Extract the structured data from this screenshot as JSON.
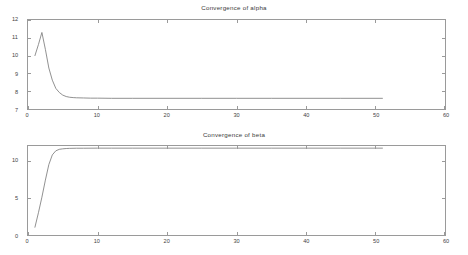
{
  "figure": {
    "background": "#ffffff",
    "axis_color": "#9a9a9a",
    "curve_color": "#7d7d7d"
  },
  "panels": [
    {
      "id": "alpha",
      "title": "Convergence of alpha",
      "xticks": [
        "0",
        "10",
        "20",
        "30",
        "40",
        "50",
        "60"
      ],
      "yticks": [
        "7",
        "8",
        "9",
        "10",
        "11",
        "12"
      ]
    },
    {
      "id": "beta",
      "title": "Convergence of beta",
      "xticks": [
        "0",
        "10",
        "20",
        "30",
        "40",
        "50",
        "60"
      ],
      "yticks": [
        "0",
        "5",
        "10"
      ]
    }
  ],
  "chart_data": [
    {
      "type": "line",
      "title": "Convergence of alpha",
      "xlabel": "",
      "ylabel": "",
      "xlim": [
        0,
        60
      ],
      "ylim": [
        7,
        12
      ],
      "xticks": [
        0,
        10,
        20,
        30,
        40,
        50,
        60
      ],
      "yticks": [
        7,
        8,
        9,
        10,
        11,
        12
      ],
      "grid": false,
      "legend": null,
      "series": [
        {
          "name": "alpha",
          "x": [
            1,
            1.5,
            2,
            2.5,
            3,
            3.5,
            4,
            4.5,
            5,
            5.5,
            6,
            6.5,
            7,
            8,
            9,
            10,
            12,
            15,
            20,
            25,
            30,
            35,
            40,
            45,
            51
          ],
          "y": [
            10.0,
            10.62,
            11.3,
            10.35,
            9.3,
            8.62,
            8.16,
            7.93,
            7.78,
            7.7,
            7.66,
            7.64,
            7.63,
            7.62,
            7.61,
            7.61,
            7.6,
            7.6,
            7.6,
            7.6,
            7.6,
            7.6,
            7.6,
            7.6,
            7.6
          ]
        }
      ]
    },
    {
      "type": "line",
      "title": "Convergence of beta",
      "xlabel": "",
      "ylabel": "",
      "xlim": [
        0,
        60
      ],
      "ylim": [
        0,
        12
      ],
      "xticks": [
        0,
        10,
        20,
        30,
        40,
        50,
        60
      ],
      "yticks": [
        0,
        5,
        10
      ],
      "grid": false,
      "legend": null,
      "series": [
        {
          "name": "beta",
          "x": [
            1,
            1.5,
            2,
            2.5,
            3,
            3.5,
            4,
            4.5,
            5,
            5.5,
            6,
            7,
            8,
            10,
            12,
            15,
            20,
            25,
            30,
            35,
            40,
            45,
            51
          ],
          "y": [
            1.05,
            3.0,
            5.1,
            7.4,
            9.5,
            10.8,
            11.35,
            11.55,
            11.62,
            11.66,
            11.68,
            11.7,
            11.7,
            11.71,
            11.71,
            11.71,
            11.71,
            11.71,
            11.71,
            11.71,
            11.71,
            11.71,
            11.71
          ]
        }
      ]
    }
  ]
}
